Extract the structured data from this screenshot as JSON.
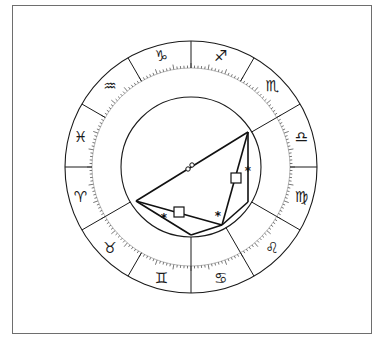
{
  "chart_title": "",
  "wheel": {
    "center": [
      191,
      167
    ],
    "outer_radius": 126,
    "tick_radius": 99,
    "inner_radius": 70,
    "line_color": "#1a1a1a"
  },
  "signs": [
    {
      "name": "capricorn",
      "glyph": "♑",
      "angle_deg": 105
    },
    {
      "name": "sagittarius",
      "glyph": "♐",
      "angle_deg": 75
    },
    {
      "name": "scorpio",
      "glyph": "♏",
      "angle_deg": 45
    },
    {
      "name": "libra",
      "glyph": "♎",
      "angle_deg": 15
    },
    {
      "name": "virgo",
      "glyph": "♍",
      "angle_deg": -15
    },
    {
      "name": "leo",
      "glyph": "♌",
      "angle_deg": -45
    },
    {
      "name": "cancer",
      "glyph": "♋",
      "angle_deg": -75
    },
    {
      "name": "gemini",
      "glyph": "♊",
      "angle_deg": -105
    },
    {
      "name": "taurus",
      "glyph": "♉",
      "angle_deg": -135
    },
    {
      "name": "aries",
      "glyph": "♈",
      "angle_deg": -165
    },
    {
      "name": "pisces",
      "glyph": "♓",
      "angle_deg": 165
    },
    {
      "name": "aquarius",
      "glyph": "♒",
      "angle_deg": 135
    }
  ],
  "aspect_points": {
    "A": [
      248,
      132
    ],
    "B": [
      136,
      201
    ],
    "C": [
      191,
      235
    ],
    "D": [
      222,
      225
    ],
    "E": [
      248,
      202
    ]
  },
  "aspects": [
    {
      "from": "B",
      "to": "A",
      "type": "opposition",
      "glyph": "☍",
      "label_pos": [
        190,
        167
      ]
    },
    {
      "from": "B",
      "to": "D",
      "type": "square",
      "glyph": "□",
      "label_pos": [
        179,
        212
      ]
    },
    {
      "from": "B",
      "to": "C",
      "type": "sextile",
      "glyph": "✱",
      "label_pos": [
        164,
        218
      ]
    },
    {
      "from": "A",
      "to": "D",
      "type": "square",
      "glyph": "□",
      "label_pos": [
        236,
        178
      ]
    },
    {
      "from": "A",
      "to": "E",
      "type": "sextile",
      "glyph": "✱",
      "label_pos": [
        248,
        171
      ]
    },
    {
      "from": "C",
      "to": "D",
      "type": "sextile",
      "glyph": "✱",
      "label_pos": [
        218,
        216
      ]
    },
    {
      "from": "D",
      "to": "E",
      "type": "line",
      "glyph": ""
    }
  ]
}
